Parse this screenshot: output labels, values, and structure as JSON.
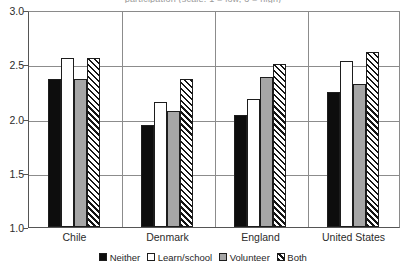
{
  "figure": {
    "clipped_title": "participation (scale: 1 = low, 3 = high)"
  },
  "chart_data": {
    "type": "bar",
    "title": "",
    "xlabel": "",
    "ylabel": "",
    "ylim": [
      1.0,
      3.0
    ],
    "ytick_labels": [
      "3.0",
      "2.5",
      "2.0",
      "1.5",
      "1.0"
    ],
    "ytick_values": [
      3.0,
      2.5,
      2.0,
      1.5,
      1.0
    ],
    "grid": true,
    "legend_position": "bottom",
    "categories": [
      "Chile",
      "Denmark",
      "England",
      "United States"
    ],
    "series": [
      {
        "name": "Neither",
        "fill": "solid-black",
        "color": "#0d0d0d",
        "values": [
          2.36,
          1.94,
          2.03,
          2.24
        ]
      },
      {
        "name": "Learn/school",
        "fill": "solid-white",
        "color": "#ffffff",
        "values": [
          2.56,
          2.15,
          2.18,
          2.53
        ]
      },
      {
        "name": "Volunteer",
        "fill": "solid-gray",
        "color": "#a6a6a6",
        "values": [
          2.36,
          2.07,
          2.38,
          2.32
        ]
      },
      {
        "name": "Both",
        "fill": "diagonal-hatch",
        "color": "#ffffff",
        "values": [
          2.56,
          2.36,
          2.5,
          2.61
        ]
      }
    ]
  },
  "legend": {
    "items": [
      {
        "label": "Neither"
      },
      {
        "label": "Learn/school"
      },
      {
        "label": "Volunteer"
      },
      {
        "label": "Both"
      }
    ]
  }
}
